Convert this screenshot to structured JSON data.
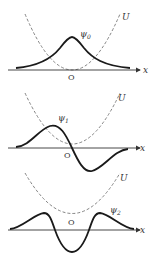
{
  "panels": [
    {
      "wave_label": "ψ",
      "wave_sub": "0",
      "potential_label": "U",
      "axis_label": "x",
      "origin_label": "O"
    },
    {
      "wave_label": "ψ",
      "wave_sub": "1",
      "potential_label": "U",
      "axis_label": "x",
      "origin_label": "O"
    },
    {
      "wave_label": "ψ",
      "wave_sub": "2",
      "potential_label": "U",
      "axis_label": "x",
      "origin_label": "O"
    }
  ],
  "colors": {
    "wave": "#1a1a1a",
    "potential": "#666666",
    "axis": "#333333"
  }
}
